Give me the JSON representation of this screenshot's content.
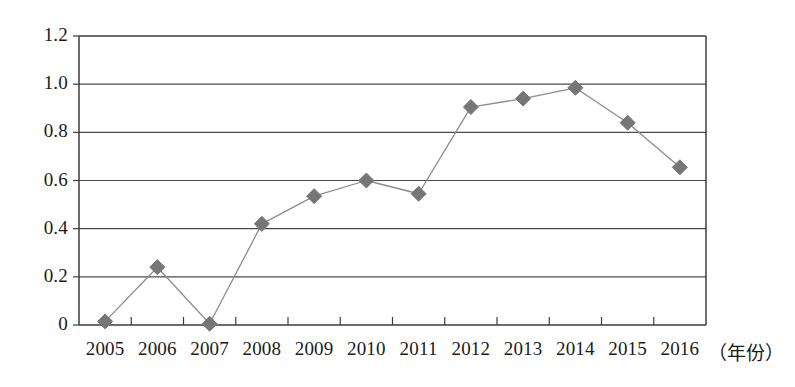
{
  "chart_data": {
    "type": "line",
    "title": "",
    "xlabel": "（年份）",
    "ylabel": "",
    "categories": [
      "2005",
      "2006",
      "2007",
      "2008",
      "2009",
      "2010",
      "2011",
      "2012",
      "2013",
      "2014",
      "2015",
      "2016"
    ],
    "values": [
      0.015,
      0.24,
      0.005,
      0.42,
      0.535,
      0.6,
      0.545,
      0.905,
      0.94,
      0.985,
      0.84,
      0.655
    ],
    "series": [
      {
        "name": "",
        "values": [
          0.015,
          0.24,
          0.005,
          0.42,
          0.535,
          0.6,
          0.545,
          0.905,
          0.94,
          0.985,
          0.84,
          0.655
        ]
      }
    ],
    "ylim": [
      0,
      1.2
    ],
    "ytick_labels": [
      "0",
      "0.2",
      "0.4",
      "0.6",
      "0.8",
      "1.0",
      "1.2"
    ],
    "ytick_values": [
      0,
      0.2,
      0.4,
      0.6,
      0.8,
      1.0,
      1.2
    ],
    "xtick_labels": [
      "2005",
      "2006",
      "2007",
      "2008",
      "2009",
      "2010",
      "2011",
      "2012",
      "2013",
      "2014",
      "2015",
      "2016"
    ],
    "grid": true,
    "grid_axis": "y",
    "legend": false,
    "legend_position": "none",
    "marker": "diamond",
    "colors": {
      "line": "#8c8c8c",
      "marker": "#767676",
      "axis": "#3c3c3c",
      "grid": "#4a4a4a",
      "text": "#1b1b1b",
      "background": "#ffffff"
    }
  },
  "axis_unit_label": "（年份）"
}
